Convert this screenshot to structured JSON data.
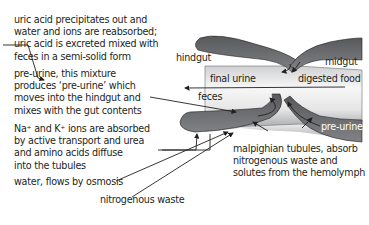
{
  "left_notes": [
    [
      "uric acid precipitates out and",
      "water and ions are reabsorbed;",
      "uric acid is excreted mixed with",
      "feces in a semi-solid form"
    ],
    [
      "pre-urine, this mixture",
      "produces ‘pre-urine’ which",
      "moves into the hindgut and",
      "mixes with the gut contents"
    ],
    [
      "Na⁺ and K⁺ ions are absorbed",
      "by active transport and urea",
      "and amino acids diffuse",
      "into the tubules"
    ],
    [
      "water, flows by osmosis"
    ],
    [
      "nitrogenous waste"
    ]
  ],
  "diagram_labels": {
    "hindgut": "hindgut",
    "midgut": "midgut",
    "final_urine": "final urine",
    "digested_food": "digested food",
    "feces": "feces",
    "pre_urine": "pre-urine",
    "tubules": [
      "malpighian tubules, absorb",
      "nitrogenous waste and",
      "solutes  from the hemolymph"
    ]
  },
  "colors": {
    "tubule_fill": "#6d6e71",
    "gut_fill_light": "#f2f2f2",
    "gut_fill_dark": "#bcbdc0",
    "line": "#231f20"
  }
}
